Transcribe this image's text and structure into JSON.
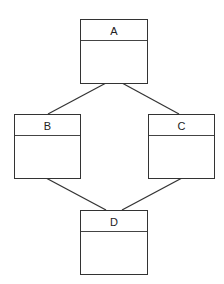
{
  "diagram": {
    "type": "class-hierarchy",
    "nodes": [
      {
        "id": "A",
        "label": "A"
      },
      {
        "id": "B",
        "label": "B"
      },
      {
        "id": "C",
        "label": "C"
      },
      {
        "id": "D",
        "label": "D"
      }
    ],
    "edges": [
      {
        "from": "A",
        "to": "B"
      },
      {
        "from": "A",
        "to": "C"
      },
      {
        "from": "B",
        "to": "D"
      },
      {
        "from": "C",
        "to": "D"
      }
    ]
  }
}
